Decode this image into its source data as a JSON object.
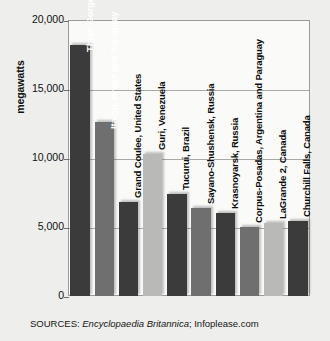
{
  "chart_data": {
    "type": "bar",
    "title": "",
    "xlabel": "",
    "ylabel": "megawatts",
    "ylim": [
      0,
      20000
    ],
    "yticks": [
      0,
      5000,
      10000,
      15000,
      20000
    ],
    "ytick_labels": [
      "0",
      "5,000",
      "10,000",
      "15,000",
      "20,000"
    ],
    "grid": true,
    "legend": "none",
    "categories": [
      "Three Gorges, China",
      "Itaipu, Brazil and Paraguay",
      "Grand Coulee, United States",
      "Guri, Venezuela",
      "Tucurui, Brazil",
      "Sayano-Shushensk, Russia",
      "Krasnoyarsk, Russia",
      "Corpus-Posadas, Argentina and Paraguay",
      "LaGrande 2, Canada",
      "Churchill Falls, Canada"
    ],
    "values": [
      18200,
      12600,
      6800,
      10300,
      7400,
      6400,
      6000,
      5000,
      5300,
      5400
    ]
  },
  "bars": [
    {
      "label": "Three Gorges, China",
      "value": 18200,
      "shade": "dark",
      "label_position": "inside"
    },
    {
      "label": "Itaipu, Brazil and Paraguay",
      "value": 12600,
      "shade": "mid",
      "label_position": "inside"
    },
    {
      "label": "Grand Coulee, United States",
      "value": 6800,
      "shade": "dark",
      "label_position": "outside"
    },
    {
      "label": "Guri, Venezuela",
      "value": 10300,
      "shade": "light",
      "label_position": "outside"
    },
    {
      "label": "Tucurui, Brazil",
      "value": 7400,
      "shade": "dark",
      "label_position": "outside"
    },
    {
      "label": "Sayano-Shushensk, Russia",
      "value": 6400,
      "shade": "mid",
      "label_position": "outside"
    },
    {
      "label": "Krasnoyarsk, Russia",
      "value": 6000,
      "shade": "dark",
      "label_position": "outside"
    },
    {
      "label": "Corpus-Posadas, Argentina and Paraguay",
      "value": 5000,
      "shade": "mid",
      "label_position": "outside"
    },
    {
      "label": "LaGrande 2, Canada",
      "value": 5300,
      "shade": "light",
      "label_position": "outside"
    },
    {
      "label": "Churchill Falls, Canada",
      "value": 5400,
      "shade": "dark",
      "label_position": "outside"
    }
  ],
  "axis": {
    "y_title": "megawatts",
    "ticks": [
      "20,000",
      "15,000",
      "10,000",
      "5,000",
      "0"
    ]
  },
  "source": {
    "prefix": "SOURCES: ",
    "italic_part": "Encyclopaedia Britannica",
    "suffix": "; Infoplease.com"
  },
  "colors": {
    "bar_dark": "#3b3b3b",
    "bar_mid": "#6f6f6f",
    "bar_light": "#b9b9b7",
    "background": "#eeeeec",
    "plot_background": "#fafaf8",
    "gridline": "#a8a8a6",
    "frame": "#9a9a98",
    "text": "#111111",
    "label_inside": "#ffffff"
  }
}
